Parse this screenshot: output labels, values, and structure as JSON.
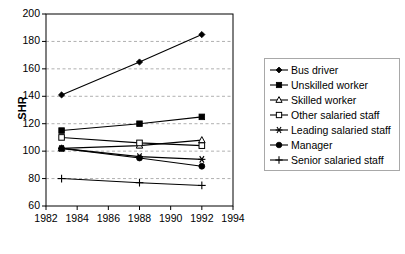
{
  "chart_data": {
    "type": "line",
    "title": "",
    "xlabel": "",
    "ylabel": "SHR",
    "xlim": [
      1982,
      1994
    ],
    "ylim": [
      60,
      200
    ],
    "xticks": [
      1982,
      1984,
      1986,
      1988,
      1990,
      1992,
      1994
    ],
    "yticks": [
      60,
      80,
      100,
      120,
      140,
      160,
      180,
      200
    ],
    "grid": "horizontal-dashed",
    "legend_position": "right",
    "x": [
      1983,
      1988,
      1992
    ],
    "series": [
      {
        "name": "Bus driver",
        "marker": "filled-diamond",
        "values": [
          141,
          165,
          185
        ]
      },
      {
        "name": "Unskilled worker",
        "marker": "filled-square",
        "values": [
          115,
          120,
          125
        ]
      },
      {
        "name": "Skilled worker",
        "marker": "open-triangle",
        "values": [
          102,
          104,
          108
        ]
      },
      {
        "name": "Other salaried staff",
        "marker": "open-square",
        "values": [
          110,
          106,
          104
        ]
      },
      {
        "name": "Leading salaried staff",
        "marker": "asterisk",
        "values": [
          102,
          96,
          94
        ]
      },
      {
        "name": "Manager",
        "marker": "filled-circle",
        "values": [
          102,
          95,
          89
        ]
      },
      {
        "name": "Senior salaried staff",
        "marker": "plus",
        "values": [
          80,
          77,
          75
        ]
      }
    ]
  },
  "axis": {
    "y_title": "SHR",
    "y_tick_labels": [
      "200",
      "180",
      "160",
      "140",
      "120",
      "100",
      "80",
      "60"
    ],
    "x_tick_labels": [
      "1982",
      "1984",
      "1986",
      "1988",
      "1990",
      "1992",
      "1994"
    ]
  },
  "legend": {
    "items": [
      {
        "label": "Bus driver"
      },
      {
        "label": "Unskilled worker"
      },
      {
        "label": "Skilled worker"
      },
      {
        "label": "Other salaried staff"
      },
      {
        "label": "Leading salaried staff"
      },
      {
        "label": "Manager"
      },
      {
        "label": "Senior salaried staff"
      }
    ]
  },
  "style": {
    "line_color": "#000000",
    "grid_color": "#b0b0b0",
    "axis_color": "#000000",
    "background": "#ffffff"
  }
}
